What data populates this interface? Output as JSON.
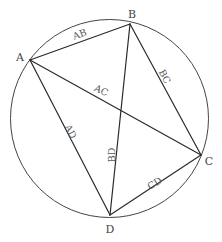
{
  "diagram": {
    "circle": {
      "cx": 109.5,
      "cy": 118.5,
      "r": 99
    },
    "colors": {
      "stroke": "#2a2a2a",
      "circle": "#444444",
      "text": "#444444",
      "background": "#ffffff"
    },
    "vertices": [
      {
        "name": "A",
        "x": 30,
        "y": 60,
        "label": "A",
        "lx": 20,
        "ly": 58
      },
      {
        "name": "B",
        "x": 130,
        "y": 24,
        "label": "B",
        "lx": 132,
        "ly": 15
      },
      {
        "name": "C",
        "x": 201,
        "y": 155,
        "label": "C",
        "lx": 209,
        "ly": 162
      },
      {
        "name": "D",
        "x": 110,
        "y": 215,
        "label": "D",
        "lx": 110,
        "ly": 230
      }
    ],
    "edges": [
      {
        "from": "A",
        "to": "B",
        "label": "AB",
        "lx": 80,
        "ly": 35,
        "angle": -20
      },
      {
        "from": "A",
        "to": "C",
        "label": "AC",
        "lx": 101,
        "ly": 91,
        "angle": 25
      },
      {
        "from": "B",
        "to": "C",
        "label": "BC",
        "lx": 164,
        "ly": 77,
        "angle": 62
      },
      {
        "from": "A",
        "to": "D",
        "label": "AD",
        "lx": 70,
        "ly": 132,
        "angle": 62
      },
      {
        "from": "B",
        "to": "D",
        "label": "BD",
        "lx": 112,
        "ly": 155,
        "angle": -90
      },
      {
        "from": "C",
        "to": "D",
        "label": "CD",
        "lx": 155,
        "ly": 184,
        "angle": -32
      }
    ]
  }
}
